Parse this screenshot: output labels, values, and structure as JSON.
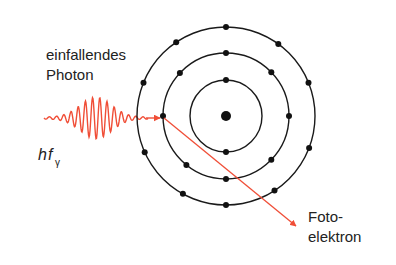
{
  "labels": {
    "incoming_line1": "einfallendes",
    "incoming_line2": "Photon",
    "energy_h": "h",
    "energy_f": "f",
    "energy_sub": "γ",
    "out_line1": "Foto-",
    "out_line2": "elektron"
  },
  "colors": {
    "photon": "#f04e37",
    "orbit": "#1a1a1a",
    "electron": "#111111",
    "text": "#222222"
  },
  "atom": {
    "shells": [
      {
        "name": "inner",
        "electron_angles_deg": [
          90,
          270
        ]
      },
      {
        "name": "middle",
        "electron_angles_deg": [
          0,
          44,
          90,
          137,
          180,
          231,
          270,
          316
        ]
      },
      {
        "name": "outer",
        "electron_angles_deg": [
          22,
          54,
          90,
          124,
          158,
          204,
          241,
          270,
          303,
          339
        ]
      }
    ],
    "ejected_electron": {
      "shell": "middle",
      "angle_deg": 180
    }
  }
}
